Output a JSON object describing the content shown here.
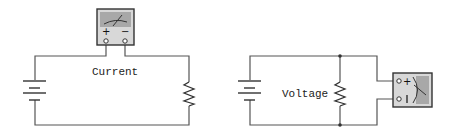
{
  "diagrams": [
    {
      "id": "current-measurement",
      "label": "Current",
      "meter": {
        "connection": "series",
        "terminals": [
          "+",
          "−"
        ]
      },
      "components": [
        "battery",
        "ammeter",
        "resistor"
      ]
    },
    {
      "id": "voltage-measurement",
      "label": "Voltage",
      "meter": {
        "connection": "parallel",
        "terminals": [
          "+",
          "−"
        ]
      },
      "components": [
        "battery",
        "resistor",
        "voltmeter"
      ]
    }
  ],
  "colors": {
    "wire": "#555555",
    "meter_body": "#d8d8d8",
    "meter_face": "#a8a8a8",
    "meter_border": "#333333"
  }
}
